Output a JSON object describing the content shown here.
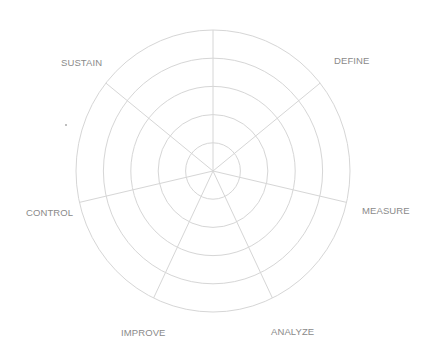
{
  "diagram": {
    "type": "polar-grid",
    "center": [
      213,
      171
    ],
    "radius_x": 137,
    "radius_y": 141,
    "ring_count": 5,
    "spoke_count": 7,
    "grid_color": "#d6d6d6",
    "label_color": "#8a8a8a",
    "labels": [
      {
        "text": "DEFINE",
        "x": 334,
        "y": 56
      },
      {
        "text": "MEASURE",
        "x": 362,
        "y": 206
      },
      {
        "text": "ANALYZE",
        "x": 271,
        "y": 327
      },
      {
        "text": "IMPROVE",
        "x": 121,
        "y": 328
      },
      {
        "text": "CONTROL",
        "x": 26,
        "y": 208
      },
      {
        "text": "SUSTAIN",
        "x": 61,
        "y": 58
      }
    ]
  }
}
